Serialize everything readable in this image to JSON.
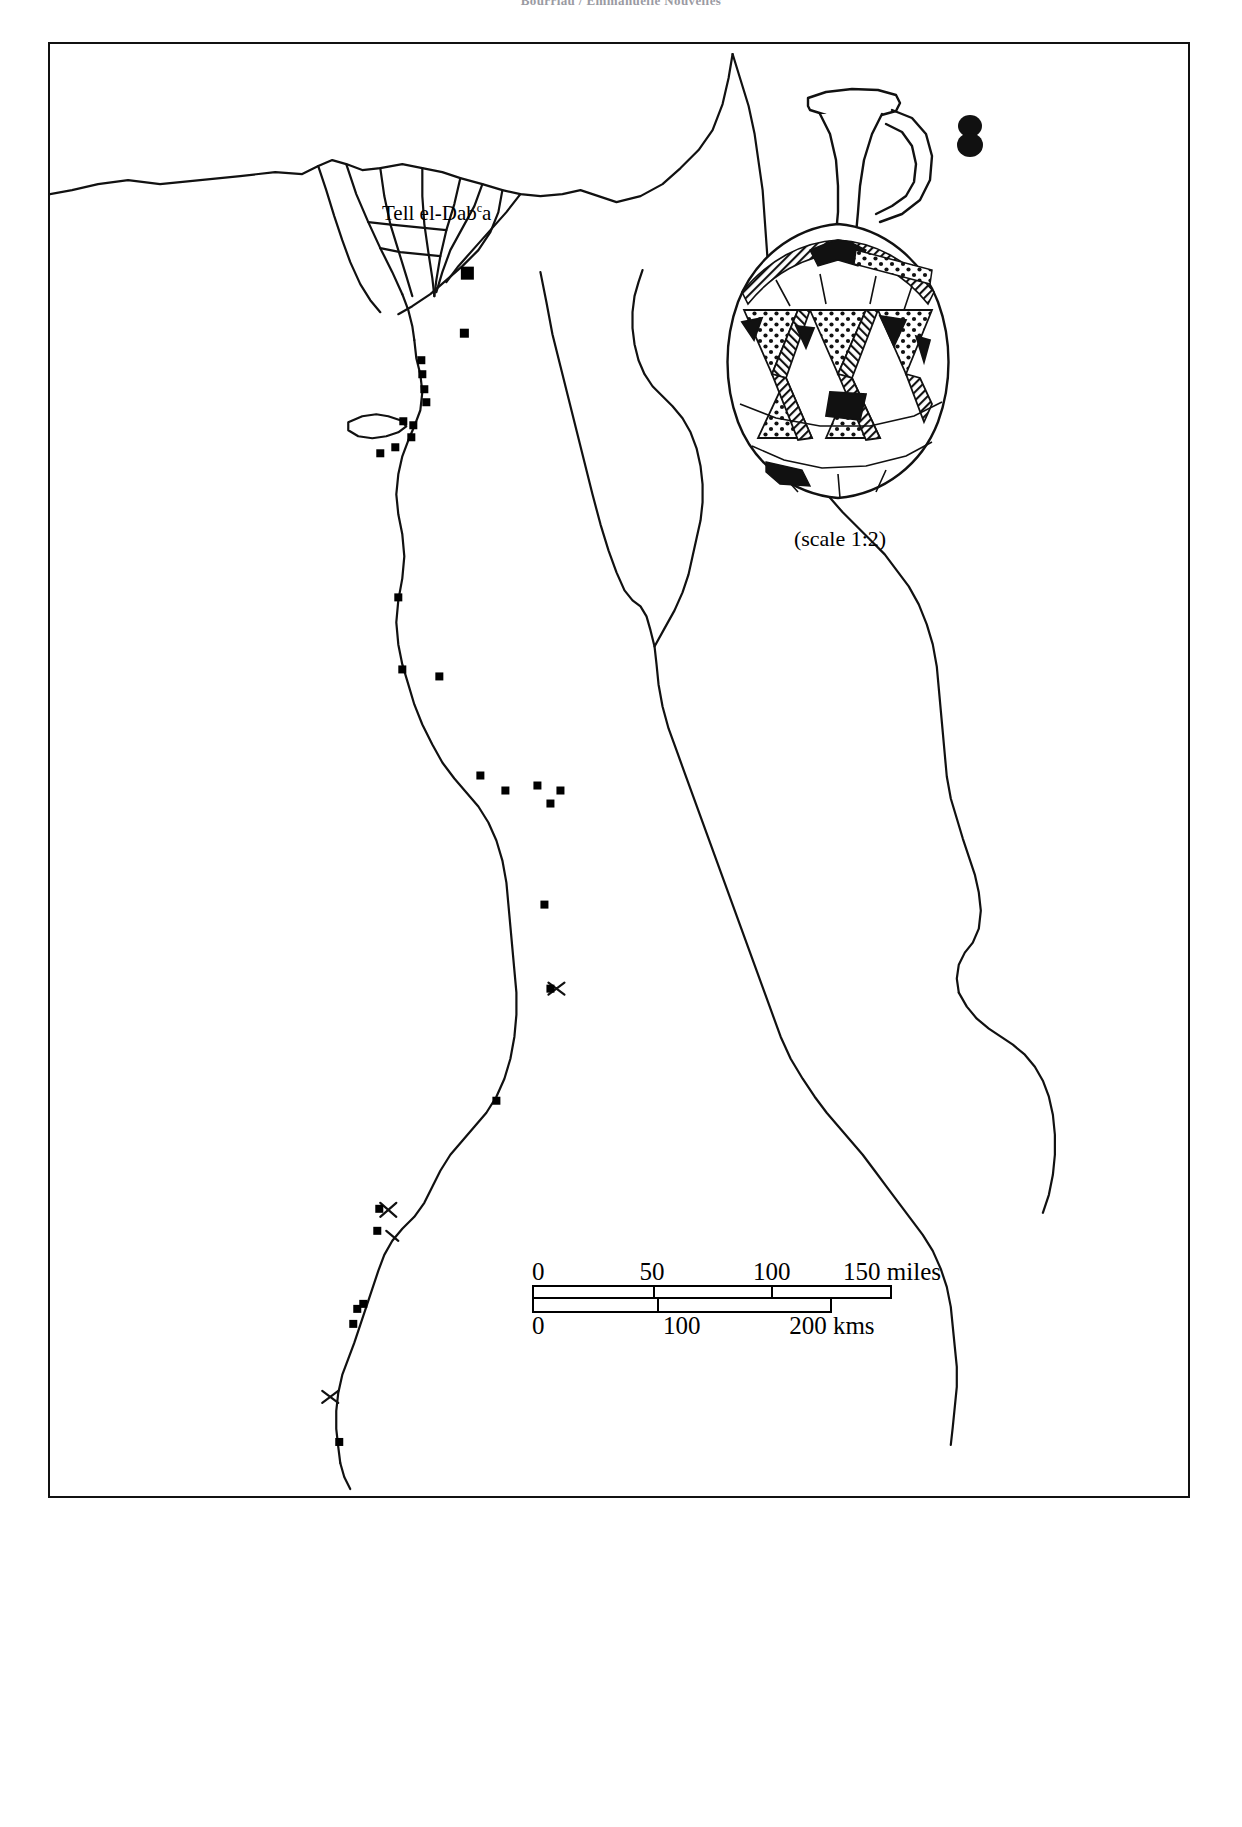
{
  "running_head": {
    "text": "Bourriau / Emmanuelle Nouvelles"
  },
  "figure": {
    "map_region_name": "Egypt and Nile Valley",
    "site_label": {
      "name": "Tell el-Dab",
      "superscript": "c",
      "suffix": "a"
    },
    "vessel": {
      "caption": "(scale 1:2)",
      "description": "Tell el-Yahudiyeh piriform juglet with punctate-filled triangle decoration"
    },
    "scale_bar": {
      "miles": {
        "ticks": [
          "0",
          "50",
          "100",
          "150 miles"
        ],
        "positions": [
          0,
          33.3,
          66.6,
          100
        ]
      },
      "kms": {
        "ticks": [
          "0",
          "100",
          "200 kms"
        ],
        "positions": [
          0,
          41.6,
          83.3
        ]
      }
    },
    "sites": [
      {
        "x": 417,
        "y": 229,
        "size": 13
      },
      {
        "x": 414,
        "y": 289,
        "size": 9
      },
      {
        "x": 371,
        "y": 316,
        "size": 8
      },
      {
        "x": 372,
        "y": 330,
        "size": 8
      },
      {
        "x": 374,
        "y": 345,
        "size": 8
      },
      {
        "x": 376,
        "y": 358,
        "size": 8
      },
      {
        "x": 353,
        "y": 377,
        "size": 8
      },
      {
        "x": 363,
        "y": 381,
        "size": 8
      },
      {
        "x": 361,
        "y": 393,
        "size": 8
      },
      {
        "x": 330,
        "y": 409,
        "size": 8
      },
      {
        "x": 345,
        "y": 403,
        "size": 8
      },
      {
        "x": 348,
        "y": 553,
        "size": 8
      },
      {
        "x": 352,
        "y": 625,
        "size": 8
      },
      {
        "x": 389,
        "y": 632,
        "size": 8
      },
      {
        "x": 430,
        "y": 731,
        "size": 8
      },
      {
        "x": 455,
        "y": 746,
        "size": 8
      },
      {
        "x": 487,
        "y": 741,
        "size": 8
      },
      {
        "x": 510,
        "y": 746,
        "size": 8
      },
      {
        "x": 500,
        "y": 759,
        "size": 8
      },
      {
        "x": 494,
        "y": 860,
        "size": 8
      },
      {
        "x": 500,
        "y": 944,
        "size": 8
      },
      {
        "x": 446,
        "y": 1056,
        "size": 8
      },
      {
        "x": 329,
        "y": 1164,
        "size": 8
      },
      {
        "x": 327,
        "y": 1186,
        "size": 8
      },
      {
        "x": 307,
        "y": 1264,
        "size": 8
      },
      {
        "x": 313,
        "y": 1259,
        "size": 8
      },
      {
        "x": 303,
        "y": 1279,
        "size": 8
      },
      {
        "x": 289,
        "y": 1397,
        "size": 8
      }
    ]
  },
  "colors": {
    "ink": "#000000",
    "paper": "#ffffff",
    "running_head": "#9a9aa2"
  }
}
